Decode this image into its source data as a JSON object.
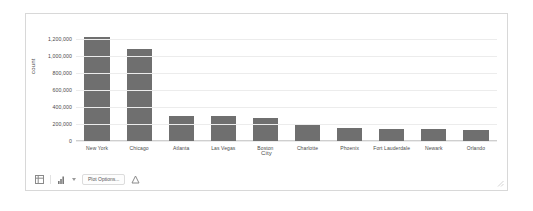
{
  "chart_data": {
    "type": "bar",
    "title": "",
    "xlabel": "City",
    "ylabel": "count",
    "ylim": [
      0,
      1300000
    ],
    "grid": true,
    "legend": "none",
    "categories": [
      "New York",
      "Chicago",
      "Atlanta",
      "Las Vegas",
      "Boston",
      "Charlotte",
      "Phoenix",
      "Fort Lauderdale",
      "Newark",
      "Orlando"
    ],
    "values": [
      1230000,
      1085000,
      300000,
      290000,
      275000,
      195000,
      150000,
      145000,
      140000,
      135000
    ],
    "yticks": [
      0,
      200000,
      400000,
      600000,
      800000,
      1000000,
      1200000
    ],
    "ytick_labels": [
      "0",
      "200,000",
      "400,000",
      "600,000",
      "800,000",
      "1,000,000",
      "1,200,000"
    ],
    "bar_color": "#6f6f6f",
    "grid_color": "#ececec"
  },
  "toolbar": {
    "table_icon": "table-icon",
    "chart_type_icon": "bar-chart-icon",
    "chart_type_caret": "chevron-down-icon",
    "plot_options_label": "Plot Options...",
    "export_icon": "export-icon"
  },
  "window": {
    "resize_handle_icon": "resize-handle-icon"
  }
}
